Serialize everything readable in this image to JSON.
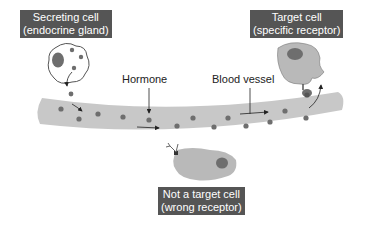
{
  "diagram": {
    "labels": {
      "secreting_cell": {
        "line1": "Secreting cell",
        "line2": "(endocrine gland)"
      },
      "target_cell": {
        "line1": "Target cell",
        "line2": "(specific receptor)"
      },
      "non_target_cell": {
        "line1": "Not a target cell",
        "line2": "(wrong receptor)"
      },
      "hormone": "Hormone",
      "blood_vessel": "Blood vessel"
    },
    "colors": {
      "label_bg": "#555555",
      "label_text": "#ffffff",
      "vessel": "#c8c8c8",
      "cell": "#b9b9b9",
      "nucleus": "#6e6e6e",
      "hormone_dot": "#6e6e6e",
      "arrow": "#222222"
    },
    "nodes": [
      {
        "id": "secreting-cell",
        "kind": "cell"
      },
      {
        "id": "blood-vessel",
        "kind": "vessel"
      },
      {
        "id": "target-cell",
        "kind": "cell",
        "receptor": "specific"
      },
      {
        "id": "non-target-cell",
        "kind": "cell",
        "receptor": "wrong"
      }
    ],
    "edges": [
      {
        "from": "secreting-cell",
        "to": "blood-vessel",
        "label": "Hormone"
      },
      {
        "from": "blood-vessel",
        "to": "target-cell"
      }
    ]
  }
}
